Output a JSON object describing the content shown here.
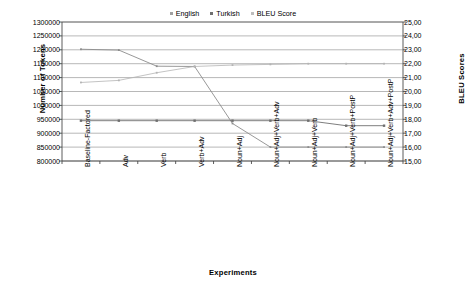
{
  "chart_data": {
    "type": "line",
    "title": "",
    "xlabel": "Experiments",
    "ylabel": "Number of Tokens",
    "y2label": "BLEU Scores",
    "grid": true,
    "legend_position": "top-center",
    "categories": [
      "Baseline-Factored",
      "Adv",
      "Verb",
      "Verb+Adv",
      "Noun+Adj",
      "Noun+Adj+Verb+Adv",
      "Noun+Adj+Verb",
      "Noun+Adj+Verb+PostP",
      "Noun+Adj+Verb+Adv+PostP"
    ],
    "ylim": [
      800000,
      1300000
    ],
    "ystep": 50000,
    "yticks": [
      "1300000",
      "1250000",
      "1200000",
      "1150000",
      "1100000",
      "1050000",
      "1000000",
      "950000",
      "900000",
      "850000",
      "800000"
    ],
    "y2lim": [
      15,
      25
    ],
    "y2step": 1,
    "y2ticks": [
      "25,00",
      "24,00",
      "23,00",
      "22,00",
      "21,00",
      "20,00",
      "19,00",
      "18,00",
      "17,00",
      "16,00",
      "15,00"
    ],
    "series": [
      {
        "name": "English",
        "axis": "left",
        "color": "#8c8c8c",
        "values": [
          1202000,
          1199000,
          1141000,
          1140000,
          935000,
          850000,
          850000,
          850000,
          850000
        ]
      },
      {
        "name": "Turkish",
        "axis": "left",
        "color": "#6f6f6f",
        "values": [
          945000,
          945000,
          945000,
          945000,
          945000,
          945000,
          945000,
          927000,
          927000
        ]
      },
      {
        "name": "BLEU Score",
        "axis": "right",
        "color": "#b4b4b4",
        "values": [
          20.65,
          20.8,
          21.35,
          21.8,
          21.9,
          21.95,
          22.0,
          22.0,
          22.0
        ]
      }
    ]
  },
  "legend": {
    "items": [
      {
        "label": "English",
        "color": "#a0a0a0"
      },
      {
        "label": "Turkish",
        "color": "#6f6f6f"
      },
      {
        "label": "BLEU Score",
        "color": "#bdbdbd"
      }
    ]
  }
}
